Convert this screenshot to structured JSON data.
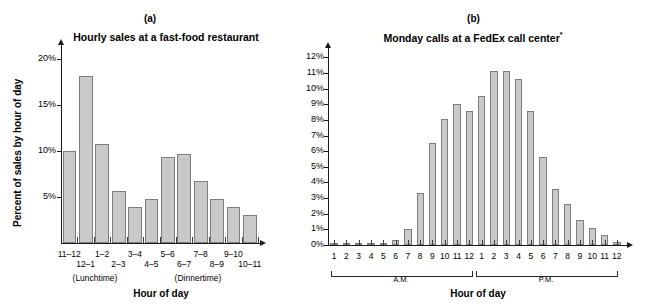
{
  "figure": {
    "panels": [
      {
        "label": "(a)",
        "title": "Hourly sales at a fast-food restaurant",
        "title_note": ""
      },
      {
        "label": "(b)",
        "title": "Monday calls at a FedEx call center",
        "title_note": "*"
      }
    ]
  },
  "panel_a": {
    "label": "(a)",
    "title": "Hourly sales at a fast-food restaurant",
    "ylabel": "Percent of sales by hour of day",
    "xlabel": "Hour of day",
    "yticks": [
      "5%",
      "10%",
      "15%",
      "20%"
    ],
    "annotations": [
      "(Lunchtime)",
      "(Dinnertime)"
    ],
    "categories_top": [
      "11–12",
      "1–2",
      "3–4",
      "5–6",
      "7–8",
      "9–10"
    ],
    "categories_bottom": [
      "12–1",
      "2–3",
      "4–5",
      "6–7",
      "8–9",
      "10–11"
    ]
  },
  "panel_b": {
    "label": "(b)",
    "title": "Monday calls at a FedEx call center",
    "title_superscript": "*",
    "ylabel": "",
    "xlabel": "Hour of day",
    "yticks": [
      "0%",
      "1%",
      "2%",
      "3%",
      "4%",
      "5%",
      "6%",
      "7%",
      "8%",
      "9%",
      "10%",
      "11%",
      "12%"
    ],
    "am_label": "A.M.",
    "pm_label": "P.M."
  },
  "chart_data": [
    {
      "type": "bar",
      "panel": "(a)",
      "title": "Hourly sales at a fast-food restaurant",
      "xlabel": "Hour of day",
      "ylabel": "Percent of sales by hour of day",
      "categories": [
        "11–12",
        "12–1",
        "1–2",
        "2–3",
        "3–4",
        "4–5",
        "5–6",
        "6–7",
        "7–8",
        "8–9",
        "9–10",
        "10–11"
      ],
      "values": [
        10.0,
        18.1,
        10.8,
        5.7,
        3.9,
        4.8,
        9.3,
        9.7,
        6.7,
        4.8,
        3.9,
        3.0
      ],
      "ylim": [
        0,
        21.5
      ],
      "ytick_values": [
        5,
        10,
        15,
        20
      ],
      "ytick_labels": [
        "5%",
        "10%",
        "15%",
        "20%"
      ],
      "grid": false,
      "legend": "none",
      "annotations": [
        {
          "text": "(Lunchtime)",
          "under": "11–12 / 12–1"
        },
        {
          "text": "(Dinnertime)",
          "under": "5–6 / 6–7"
        }
      ]
    },
    {
      "type": "bar",
      "panel": "(b)",
      "title": "Monday calls at a FedEx call center*",
      "xlabel": "Hour of day",
      "ylabel": "",
      "categories": [
        "1",
        "2",
        "3",
        "4",
        "5",
        "6",
        "7",
        "8",
        "9",
        "10",
        "11",
        "12",
        "1",
        "2",
        "3",
        "4",
        "5",
        "6",
        "7",
        "8",
        "9",
        "10",
        "11",
        "12"
      ],
      "period": [
        "A.M.",
        "A.M.",
        "A.M.",
        "A.M.",
        "A.M.",
        "A.M.",
        "A.M.",
        "A.M.",
        "A.M.",
        "A.M.",
        "A.M.",
        "A.M.",
        "P.M.",
        "P.M.",
        "P.M.",
        "P.M.",
        "P.M.",
        "P.M.",
        "P.M.",
        "P.M.",
        "P.M.",
        "P.M.",
        "P.M.",
        "P.M."
      ],
      "values": [
        0.1,
        0.1,
        0.1,
        0.1,
        0.1,
        0.3,
        1.05,
        3.3,
        6.55,
        8.05,
        9.05,
        8.55,
        9.55,
        11.1,
        11.1,
        10.6,
        8.6,
        5.6,
        3.6,
        2.6,
        1.6,
        1.1,
        0.65,
        0.2
      ],
      "ylim": [
        0,
        12.6
      ],
      "ytick_values": [
        0,
        1,
        2,
        3,
        4,
        5,
        6,
        7,
        8,
        9,
        10,
        11,
        12
      ],
      "ytick_labels": [
        "0%",
        "1%",
        "2%",
        "3%",
        "4%",
        "5%",
        "6%",
        "7%",
        "8%",
        "9%",
        "10%",
        "11%",
        "12%"
      ],
      "grid": false,
      "legend": "none"
    }
  ]
}
